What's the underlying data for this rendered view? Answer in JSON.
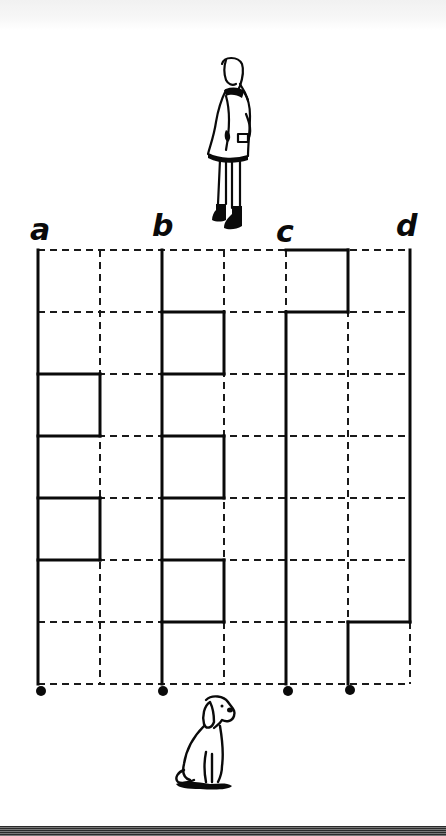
{
  "puzzle": {
    "type": "path-maze",
    "start_labels": [
      "a",
      "b",
      "c",
      "d"
    ],
    "top_figure": "girl",
    "bottom_figure": "dog",
    "grid": {
      "columns": 6,
      "rows": 7,
      "x_lines": [
        38,
        100,
        162,
        224,
        286,
        348,
        410
      ],
      "y_lines": [
        250,
        312,
        374,
        436,
        498,
        560,
        622,
        684
      ]
    },
    "end_dots": 4
  },
  "colors": {
    "ink": "#0a0a0a",
    "background": "#ffffff"
  }
}
